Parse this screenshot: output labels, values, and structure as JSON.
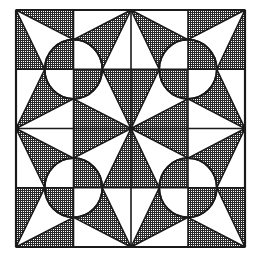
{
  "figure": {
    "colors": {
      "line": "#1a1a1a",
      "shade_dark": "#3a3a3a",
      "shade_light": "#9a9a9a",
      "background": "#ffffff"
    },
    "grid": {
      "x": [
        16,
        73.5,
        131,
        188,
        245
      ],
      "y": [
        10,
        69.25,
        128.5,
        187.75,
        247
      ]
    },
    "circle": {
      "rx": 28.75,
      "ry": 29.6
    },
    "blocks": [
      {
        "name": "top-left",
        "cx": 73.5,
        "cy": 69.25
      },
      {
        "name": "top-right",
        "cx": 188,
        "cy": 69.25
      },
      {
        "name": "bottom-left",
        "cx": 73.5,
        "cy": 187.75
      },
      {
        "name": "bottom-right",
        "cx": 188,
        "cy": 187.75
      }
    ]
  }
}
